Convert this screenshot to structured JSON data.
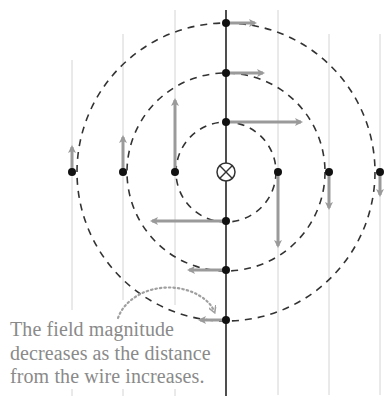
{
  "diagram": {
    "wire_symbol": "⊗",
    "wire_symbol_meaning": "current into page",
    "center": {
      "x": 226,
      "y": 172
    },
    "circles": [
      {
        "name": "inner",
        "radius": 50
      },
      {
        "name": "middle",
        "radius": 99
      },
      {
        "name": "outer",
        "radius": 149
      }
    ],
    "colors": {
      "arrow": "#9a9a9a",
      "dot": "#111111",
      "circle": "#333333",
      "gridline": "#cfcfcf",
      "wire": "#222222",
      "caption": "#8a8a8a",
      "callout": "#a0a0a0"
    },
    "field_vectors": [
      {
        "position": "top-outer",
        "x": 226,
        "y": 23,
        "x2": 257,
        "y2": 23
      },
      {
        "position": "top-middle",
        "x": 226,
        "y": 73,
        "x2": 265,
        "y2": 73
      },
      {
        "position": "top-inner",
        "x": 226,
        "y": 122,
        "x2": 303,
        "y2": 122
      },
      {
        "position": "right-inner",
        "x": 278,
        "y": 172,
        "x2": 278,
        "y2": 248
      },
      {
        "position": "right-middle",
        "x": 329,
        "y": 172,
        "x2": 329,
        "y2": 210
      },
      {
        "position": "right-outer",
        "x": 380,
        "y": 172,
        "x2": 380,
        "y2": 197
      },
      {
        "position": "bottom-inner",
        "x": 226,
        "y": 221,
        "x2": 150,
        "y2": 221
      },
      {
        "position": "bottom-middle",
        "x": 226,
        "y": 270,
        "x2": 187,
        "y2": 270
      },
      {
        "position": "bottom-outer",
        "x": 226,
        "y": 320,
        "x2": 198,
        "y2": 320
      },
      {
        "position": "left-inner",
        "x": 175,
        "y": 172,
        "x2": 175,
        "y2": 98
      },
      {
        "position": "left-middle",
        "x": 123,
        "y": 172,
        "x2": 123,
        "y2": 135
      },
      {
        "position": "left-outer",
        "x": 72,
        "y": 172,
        "x2": 72,
        "y2": 145
      }
    ],
    "caption_lines": [
      "The field magnitude",
      "decreases as the distance",
      "from the wire increases."
    ]
  }
}
